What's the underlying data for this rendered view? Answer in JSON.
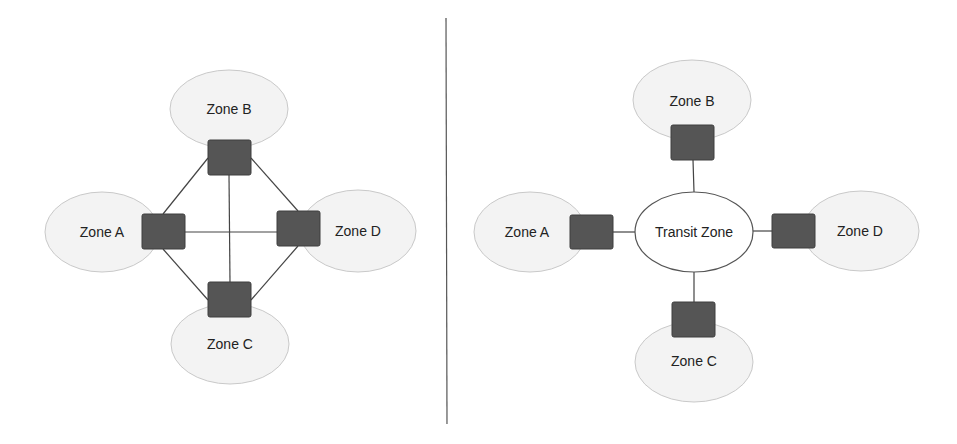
{
  "diagram": {
    "left": {
      "title": "Full mesh firewall topology",
      "zones": [
        {
          "id": "zone-b",
          "label": "Zone B"
        },
        {
          "id": "zone-a",
          "label": "Zone A"
        },
        {
          "id": "zone-d",
          "label": "Zone D"
        },
        {
          "id": "zone-c",
          "label": "Zone C"
        }
      ],
      "firewalls": [
        "zone-b-firewall",
        "zone-a-firewall",
        "zone-d-firewall",
        "zone-c-firewall"
      ],
      "links": [
        [
          "zone-a-firewall",
          "zone-b-firewall"
        ],
        [
          "zone-b-firewall",
          "zone-d-firewall"
        ],
        [
          "zone-d-firewall",
          "zone-c-firewall"
        ],
        [
          "zone-c-firewall",
          "zone-a-firewall"
        ],
        [
          "zone-a-firewall",
          "zone-d-firewall"
        ],
        [
          "zone-b-firewall",
          "zone-c-firewall"
        ]
      ]
    },
    "right": {
      "title": "Hub and spoke via transit zone",
      "hub": {
        "id": "transit-zone",
        "label": "Transit Zone"
      },
      "zones": [
        {
          "id": "zone-b",
          "label": "Zone B"
        },
        {
          "id": "zone-a",
          "label": "Zone A"
        },
        {
          "id": "zone-d",
          "label": "Zone D"
        },
        {
          "id": "zone-c",
          "label": "Zone C"
        }
      ],
      "links": [
        [
          "zone-b-firewall",
          "transit-zone"
        ],
        [
          "zone-a-firewall",
          "transit-zone"
        ],
        [
          "zone-d-firewall",
          "transit-zone"
        ],
        [
          "zone-c-firewall",
          "transit-zone"
        ]
      ]
    },
    "colors": {
      "zone_fill": "#f3f3f3",
      "zone_stroke": "#c9c9c9",
      "firewall_fill": "#555555",
      "line": "#444444",
      "background": "#ffffff"
    }
  }
}
